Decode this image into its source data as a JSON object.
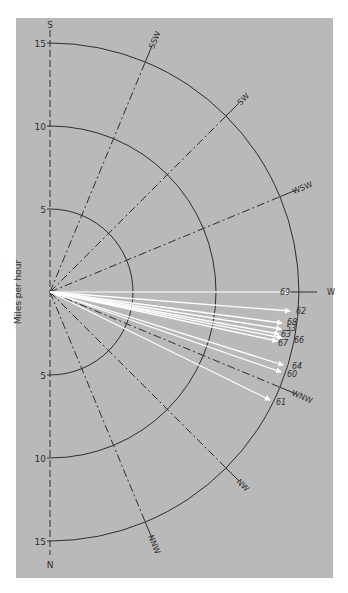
{
  "diagram": {
    "type": "polar-wind-diagram",
    "y_axis_label": "Miles per hour",
    "axis_top_label": "S",
    "axis_bottom_label": "N",
    "rings": [
      {
        "value": 5,
        "label": "5"
      },
      {
        "value": 10,
        "label": "10"
      },
      {
        "value": 15,
        "label": "15"
      }
    ],
    "directions": [
      {
        "label": "SSW",
        "angle": 22.5
      },
      {
        "label": "SW",
        "angle": 45
      },
      {
        "label": "WSW",
        "angle": 67.5
      },
      {
        "label": "W",
        "angle": 90
      },
      {
        "label": "WNW",
        "angle": 112.5
      },
      {
        "label": "NW",
        "angle": 135
      },
      {
        "label": "NNW",
        "angle": 157.5
      }
    ],
    "arrows": [
      {
        "label": "69",
        "end": [
          290,
          292
        ],
        "label_pos": [
          280,
          295
        ]
      },
      {
        "label": "62",
        "end": [
          290,
          311
        ],
        "label_pos": [
          296,
          314
        ]
      },
      {
        "label": "68",
        "end": [
          282,
          323
        ],
        "label_pos": [
          287,
          325
        ]
      },
      {
        "label": "53",
        "end": [
          281,
          329
        ],
        "label_pos": [
          286,
          331
        ]
      },
      {
        "label": "63",
        "end": [
          279,
          334
        ],
        "label_pos": [
          281,
          337
        ]
      },
      {
        "label": "66",
        "end": [
          282,
          338
        ],
        "label_pos": [
          294,
          343
        ]
      },
      {
        "label": "67",
        "end": [
          277,
          341
        ],
        "label_pos": [
          278,
          346
        ]
      },
      {
        "label": "64",
        "end": [
          283,
          365
        ],
        "label_pos": [
          292,
          369
        ]
      },
      {
        "label": "60",
        "end": [
          281,
          372
        ],
        "label_pos": [
          287,
          377
        ]
      },
      {
        "label": "61",
        "end": [
          270,
          400
        ],
        "label_pos": [
          276,
          405
        ]
      }
    ]
  },
  "colors": {
    "panel_bg": "#b9b9b9",
    "line": "#2e2e2e",
    "arrow": "#ffffff"
  }
}
